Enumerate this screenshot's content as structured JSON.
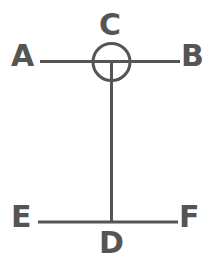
{
  "figure": {
    "type": "geometry-line-diagram",
    "background_color": "#ffffff",
    "stroke_color": "#555555",
    "stroke_width": 3,
    "width": 213,
    "height": 272,
    "labels": {
      "a": "A",
      "b": "B",
      "c": "C",
      "d": "D",
      "e": "E",
      "f": "F"
    },
    "shapes": {
      "circle": {
        "name": "circle-at-c",
        "cx": 111.5,
        "cy": 62,
        "r": 18.5
      },
      "top_line": {
        "name": "line-ab",
        "x1": 40,
        "y1": 61.5,
        "x2": 180,
        "y2": 61.5
      },
      "vertical_line": {
        "name": "line-cd",
        "x1": 111.5,
        "y1": 62,
        "x2": 111.5,
        "y2": 222
      },
      "bottom_line": {
        "name": "line-ef",
        "x1": 38,
        "y1": 222,
        "x2": 178,
        "y2": 222
      }
    }
  }
}
